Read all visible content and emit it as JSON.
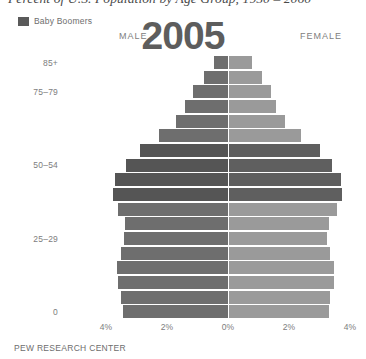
{
  "title": "Percent of U.S. Population by Age Group, 1950 – 2060",
  "legend": {
    "label": "Baby Boomers",
    "swatch_color": "#5a5a5a"
  },
  "header": {
    "male_label": "MALE",
    "female_label": "FEMALE",
    "year": "2005"
  },
  "footer": "PEW RESEARCH CENTER",
  "colors": {
    "male_bar": "#6e6e6e",
    "female_bar": "#9a9a9a",
    "boomer_male_bar": "#555555",
    "boomer_female_bar": "#5f5f5f",
    "axis_text": "#7d7d7d",
    "background": "#ffffff"
  },
  "chart_data": {
    "type": "bar",
    "subtype": "population-pyramid",
    "title": "Percent of U.S. Population by Age Group, 1950 – 2060",
    "year": "2005",
    "xlabel": "",
    "ylabel": "",
    "xlim": [
      -4,
      4
    ],
    "xticks": [
      -4,
      -2,
      0,
      2,
      4
    ],
    "xtick_labels": [
      "4%",
      "2%",
      "0%",
      "2%",
      "4%"
    ],
    "grid": false,
    "legend_position": "top-left",
    "categories": [
      "0–4",
      "5–9",
      "10–14",
      "15–19",
      "20–24",
      "25–29",
      "30–34",
      "35–39",
      "40–44",
      "45–49",
      "50–54",
      "55–59",
      "60–64",
      "65–69",
      "70–74",
      "75–79",
      "80–84",
      "85+"
    ],
    "ytick_labels": [
      "0",
      "25–29",
      "50–54",
      "75–79",
      "85+"
    ],
    "ytick_categories": [
      "0–4",
      "25–29",
      "50–54",
      "75–79",
      "85+"
    ],
    "series": [
      {
        "name": "MALE",
        "side": "left",
        "values": [
          3.45,
          3.5,
          3.62,
          3.64,
          3.5,
          3.4,
          3.38,
          3.62,
          3.76,
          3.7,
          3.35,
          2.9,
          2.25,
          1.72,
          1.4,
          1.15,
          0.8,
          0.45
        ]
      },
      {
        "name": "FEMALE",
        "side": "right",
        "values": [
          3.3,
          3.35,
          3.46,
          3.46,
          3.34,
          3.26,
          3.3,
          3.58,
          3.74,
          3.72,
          3.42,
          3.0,
          2.38,
          1.86,
          1.58,
          1.4,
          1.1,
          0.8
        ]
      }
    ],
    "highlight": {
      "label": "Baby Boomers",
      "categories": [
        "40–44",
        "45–49",
        "50–54",
        "55–59"
      ]
    }
  }
}
